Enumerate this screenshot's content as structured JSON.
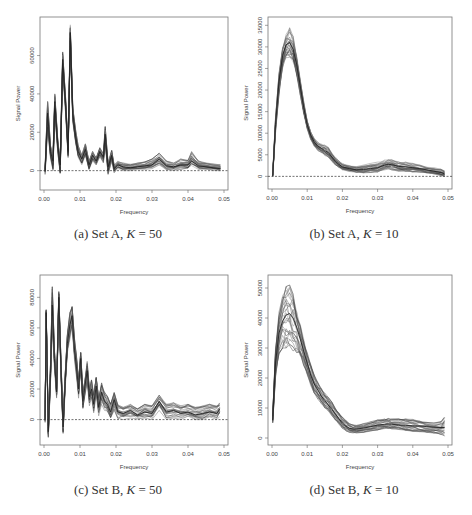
{
  "chart_data": [
    {
      "id": "a",
      "type": "line",
      "caption_prefix": "(a) Set A, ",
      "caption_k": "K",
      "caption_suffix": " = 50",
      "xlabel": "Frequency",
      "ylabel": "Signal Power",
      "xlim": [
        0.0,
        0.05
      ],
      "ylim": [
        -8000,
        78000
      ],
      "xticks": [
        "0.00",
        "0.01",
        "0.02",
        "0.03",
        "0.04",
        "0.05"
      ],
      "xtick_values": [
        0.0,
        0.01,
        0.02,
        0.03,
        0.04,
        0.05
      ],
      "yticks": [
        "0",
        "20000",
        "40000",
        "60000"
      ],
      "ytick_values": [
        0,
        20000,
        40000,
        60000
      ],
      "reference_line": 0,
      "series_count_approx": 50,
      "x": [
        0.0003,
        0.001,
        0.0018,
        0.0025,
        0.003,
        0.0038,
        0.0045,
        0.0052,
        0.006,
        0.0067,
        0.0073,
        0.008,
        0.0088,
        0.0095,
        0.0105,
        0.0115,
        0.0125,
        0.0135,
        0.0145,
        0.0155,
        0.0165,
        0.017,
        0.0178,
        0.0188,
        0.0195,
        0.0205,
        0.022,
        0.024,
        0.026,
        0.028,
        0.03,
        0.032,
        0.034,
        0.036,
        0.038,
        0.04,
        0.041,
        0.043,
        0.045,
        0.047,
        0.049
      ],
      "mean": [
        0,
        30000,
        10000,
        5000,
        36000,
        14000,
        3000,
        58000,
        35000,
        10000,
        72000,
        30000,
        18000,
        10000,
        6000,
        11000,
        3000,
        8000,
        5000,
        10000,
        7000,
        19000,
        2000,
        8000,
        1000,
        3000,
        2000,
        1500,
        2000,
        2500,
        3000,
        6000,
        2500,
        2000,
        3000,
        3000,
        5000,
        2500,
        2000,
        1500,
        1000
      ],
      "upper": [
        2000,
        36000,
        13000,
        8000,
        40000,
        17000,
        5000,
        62000,
        38000,
        13000,
        76000,
        33000,
        21000,
        13000,
        8000,
        14000,
        5000,
        10000,
        7000,
        12000,
        9000,
        23000,
        4000,
        11000,
        3000,
        5000,
        4000,
        3500,
        4000,
        4500,
        6000,
        9000,
        5000,
        4000,
        6000,
        5500,
        10000,
        5000,
        4000,
        3500,
        3000
      ],
      "lower": [
        -2000,
        22000,
        6000,
        0,
        30000,
        10000,
        -2000,
        52000,
        30000,
        6000,
        66000,
        25000,
        14000,
        7000,
        3000,
        8000,
        500,
        5000,
        3000,
        7000,
        4000,
        14000,
        -2000,
        5000,
        -1000,
        1000,
        0,
        0,
        500,
        500,
        1000,
        3000,
        500,
        0,
        500,
        1000,
        2000,
        500,
        500,
        0,
        0
      ]
    },
    {
      "id": "b",
      "type": "line",
      "caption_prefix": "(b) Set A, ",
      "caption_k": "K",
      "caption_suffix": " = 10",
      "xlabel": "Frequency",
      "ylabel": "Signal Power",
      "xlim": [
        0.0,
        0.05
      ],
      "ylim": [
        -2000,
        36000
      ],
      "xticks": [
        "0.00",
        "0.01",
        "0.02",
        "0.03",
        "0.04",
        "0.05"
      ],
      "xtick_values": [
        0.0,
        0.01,
        0.02,
        0.03,
        0.04,
        0.05
      ],
      "yticks": [
        "0",
        "5000",
        "10000",
        "15000",
        "20000",
        "25000",
        "30000",
        "35000"
      ],
      "ytick_values": [
        0,
        5000,
        10000,
        15000,
        20000,
        25000,
        30000,
        35000
      ],
      "reference_line": 0,
      "series_count_approx": 50,
      "x": [
        0.0002,
        0.001,
        0.002,
        0.003,
        0.004,
        0.005,
        0.006,
        0.007,
        0.008,
        0.009,
        0.01,
        0.011,
        0.012,
        0.013,
        0.014,
        0.015,
        0.016,
        0.017,
        0.018,
        0.019,
        0.02,
        0.022,
        0.024,
        0.026,
        0.028,
        0.03,
        0.032,
        0.033,
        0.034,
        0.036,
        0.038,
        0.04,
        0.042,
        0.044,
        0.046,
        0.048,
        0.049
      ],
      "mean": [
        0,
        12000,
        22000,
        28000,
        30500,
        31000,
        29500,
        26000,
        21000,
        16000,
        12000,
        9500,
        8000,
        7000,
        6500,
        6000,
        5500,
        4500,
        3500,
        2800,
        2200,
        1800,
        1500,
        1600,
        1800,
        2000,
        2600,
        2800,
        2700,
        2300,
        2200,
        2000,
        1800,
        1500,
        1200,
        900,
        600
      ],
      "upper": [
        500,
        14000,
        24000,
        30500,
        33000,
        34500,
        32500,
        28500,
        23000,
        17500,
        13000,
        10500,
        9000,
        8000,
        7500,
        7500,
        7000,
        5500,
        4500,
        3600,
        3000,
        2600,
        2300,
        2600,
        3000,
        3300,
        3800,
        4000,
        3900,
        3400,
        3300,
        3000,
        2700,
        2300,
        2000,
        1700,
        1400
      ],
      "lower": [
        0,
        10000,
        19000,
        25000,
        27500,
        27500,
        26500,
        23500,
        19000,
        14500,
        11000,
        8500,
        7000,
        6000,
        5500,
        4800,
        4200,
        3500,
        2600,
        2000,
        1500,
        1100,
        900,
        800,
        900,
        1000,
        1500,
        1600,
        1500,
        1200,
        1100,
        1000,
        900,
        700,
        500,
        200,
        0
      ]
    },
    {
      "id": "c",
      "type": "line",
      "caption_prefix": "(c) Set B, ",
      "caption_k": "K",
      "caption_suffix": " = 50",
      "xlabel": "Frequency",
      "ylabel": "Signal Power",
      "xlim": [
        0.0,
        0.05
      ],
      "ylim": [
        -14000,
        92000
      ],
      "xticks": [
        "0.00",
        "0.01",
        "0.02",
        "0.03",
        "0.04",
        "0.05"
      ],
      "xtick_values": [
        0.0,
        0.01,
        0.02,
        0.03,
        0.04,
        0.05
      ],
      "yticks": [
        "0",
        "20000",
        "40000",
        "60000",
        "80000"
      ],
      "ytick_values": [
        0,
        20000,
        40000,
        60000,
        80000
      ],
      "reference_line": 0,
      "series_count_approx": 50,
      "x": [
        0.0003,
        0.0006,
        0.0012,
        0.0018,
        0.0023,
        0.0029,
        0.0035,
        0.0041,
        0.0047,
        0.0053,
        0.0059,
        0.0065,
        0.0072,
        0.0078,
        0.0085,
        0.009,
        0.0096,
        0.0102,
        0.0108,
        0.0114,
        0.012,
        0.0126,
        0.0132,
        0.0138,
        0.0145,
        0.0152,
        0.016,
        0.0168,
        0.0176,
        0.0185,
        0.0195,
        0.0205,
        0.022,
        0.024,
        0.026,
        0.028,
        0.03,
        0.032,
        0.034,
        0.036,
        0.038,
        0.04,
        0.042,
        0.044,
        0.046,
        0.048,
        0.0488
      ],
      "mean": [
        0,
        70000,
        -8000,
        30000,
        75000,
        40000,
        18000,
        80000,
        35000,
        -5000,
        25000,
        50000,
        62000,
        68000,
        45000,
        35000,
        20000,
        40000,
        12000,
        22000,
        32000,
        15000,
        20000,
        10000,
        22000,
        8000,
        18000,
        12000,
        10000,
        5000,
        13000,
        5000,
        4000,
        6000,
        3000,
        5000,
        4000,
        12000,
        5000,
        6000,
        4000,
        5000,
        3000,
        4000,
        5000,
        4000,
        7000
      ],
      "upper": [
        2000,
        72000,
        -4000,
        36000,
        87000,
        46000,
        22000,
        84000,
        40000,
        0,
        30000,
        56000,
        70000,
        74000,
        52000,
        42000,
        26000,
        44000,
        18000,
        26000,
        38000,
        20000,
        26000,
        16000,
        28000,
        14000,
        24000,
        18000,
        16000,
        10000,
        18000,
        10000,
        8000,
        10000,
        7000,
        10000,
        9000,
        16000,
        10000,
        11000,
        9000,
        10000,
        8000,
        9000,
        10000,
        9000,
        11000
      ],
      "lower": [
        -2000,
        66000,
        -12000,
        24000,
        60000,
        34000,
        14000,
        74000,
        30000,
        -10000,
        20000,
        44000,
        52000,
        60000,
        38000,
        28000,
        14000,
        34000,
        6000,
        16000,
        24000,
        9000,
        14000,
        4000,
        16000,
        2000,
        10000,
        6000,
        4000,
        0,
        6000,
        0,
        0,
        1000,
        0,
        1000,
        0,
        6000,
        0,
        1000,
        0,
        1000,
        0,
        0,
        1000,
        0,
        2000
      ]
    },
    {
      "id": "d",
      "type": "line",
      "caption_prefix": "(d) Set B, ",
      "caption_k": "K",
      "caption_suffix": " = 10",
      "xlabel": "Frequency",
      "ylabel": "Signal Power",
      "xlim": [
        0.0,
        0.05
      ],
      "ylim": [
        -1000,
        53000
      ],
      "xticks": [
        "0.00",
        "0.01",
        "0.02",
        "0.03",
        "0.04",
        "0.05"
      ],
      "xtick_values": [
        0.0,
        0.01,
        0.02,
        0.03,
        0.04,
        0.05
      ],
      "yticks": [
        "0",
        "10000",
        "20000",
        "30000",
        "40000",
        "50000"
      ],
      "ytick_values": [
        0,
        10000,
        20000,
        30000,
        40000,
        50000
      ],
      "reference_line": null,
      "series_count_approx": 50,
      "x": [
        0.0002,
        0.001,
        0.002,
        0.003,
        0.004,
        0.005,
        0.006,
        0.007,
        0.008,
        0.009,
        0.01,
        0.011,
        0.012,
        0.013,
        0.014,
        0.015,
        0.016,
        0.017,
        0.018,
        0.019,
        0.02,
        0.021,
        0.022,
        0.023,
        0.024,
        0.026,
        0.028,
        0.03,
        0.032,
        0.033,
        0.034,
        0.036,
        0.038,
        0.04,
        0.042,
        0.044,
        0.046,
        0.048,
        0.049
      ],
      "mean": [
        6000,
        25000,
        35000,
        39000,
        41000,
        41500,
        40000,
        37000,
        33000,
        29000,
        25000,
        21000,
        18000,
        16000,
        14000,
        12500,
        11000,
        9500,
        8000,
        6500,
        5000,
        4000,
        3200,
        3000,
        3000,
        3300,
        3800,
        4300,
        4600,
        4700,
        4600,
        4300,
        4200,
        4100,
        4000,
        3800,
        3600,
        3500,
        3500
      ],
      "upper": [
        8000,
        30000,
        42000,
        48000,
        50500,
        51000,
        48000,
        43000,
        38000,
        33000,
        28500,
        24500,
        21000,
        18500,
        16500,
        15000,
        13500,
        12000,
        10000,
        8500,
        7000,
        5800,
        4800,
        4300,
        4200,
        4800,
        5400,
        6000,
        6400,
        6500,
        6400,
        6500,
        6600,
        6200,
        5800,
        5200,
        5000,
        5500,
        7000
      ],
      "lower": [
        5000,
        20000,
        28000,
        30000,
        30000,
        29500,
        29000,
        28500,
        27000,
        24000,
        21000,
        17500,
        15000,
        13000,
        11500,
        10000,
        9000,
        7500,
        6000,
        4500,
        3200,
        2400,
        1900,
        1700,
        1700,
        1900,
        2300,
        2700,
        3000,
        3100,
        3000,
        2700,
        2400,
        2200,
        2100,
        1900,
        1600,
        1200,
        500
      ]
    }
  ]
}
